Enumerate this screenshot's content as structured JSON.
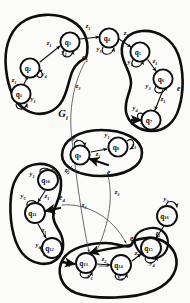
{
  "figure": {
    "title": "G",
    "title_subscript": "i",
    "background": "#fbfbfa",
    "ink_color": "#0d0d0d",
    "width": 190,
    "height": 303,
    "type": "hand-drawn-state-transition-graph"
  },
  "nodes": [
    {
      "id": "q1",
      "label": "q",
      "sub": "1",
      "cx": 21,
      "cy": 94
    },
    {
      "id": "q2",
      "label": "q",
      "sub": "2",
      "cx": 30,
      "cy": 68
    },
    {
      "id": "q3",
      "label": "q",
      "sub": "3",
      "cx": 70,
      "cy": 42
    },
    {
      "id": "q4",
      "label": "q",
      "sub": "4",
      "cx": 109,
      "cy": 38
    },
    {
      "id": "q5",
      "label": "q",
      "sub": "5",
      "cx": 140,
      "cy": 52
    },
    {
      "id": "q6",
      "label": "q",
      "sub": "6",
      "cx": 163,
      "cy": 79
    },
    {
      "id": "q7",
      "label": "q",
      "sub": "7",
      "cx": 151,
      "cy": 120
    },
    {
      "id": "q8",
      "label": "q",
      "sub": "8",
      "cx": 118,
      "cy": 147
    },
    {
      "id": "q9",
      "label": "q",
      "sub": "9",
      "cx": 80,
      "cy": 155
    },
    {
      "id": "q10",
      "label": "q",
      "sub": "10",
      "cx": 48,
      "cy": 180
    },
    {
      "id": "q11",
      "label": "q",
      "sub": "11",
      "cx": 35,
      "cy": 213
    },
    {
      "id": "q12",
      "label": "q",
      "sub": "12",
      "cx": 52,
      "cy": 248
    },
    {
      "id": "q13",
      "label": "q",
      "sub": "13",
      "cx": 86,
      "cy": 263
    },
    {
      "id": "q14",
      "label": "q",
      "sub": "14",
      "cx": 121,
      "cy": 265
    },
    {
      "id": "q15",
      "label": "q",
      "sub": "15",
      "cx": 151,
      "cy": 248
    },
    {
      "id": "q16",
      "label": "q",
      "sub": "16",
      "cx": 167,
      "cy": 216
    }
  ],
  "regions": [
    {
      "id": "e1",
      "label": "e",
      "sub": "1",
      "x": 85,
      "y": 58
    },
    {
      "id": "e2",
      "label": "e",
      "sub": "2",
      "x": 181,
      "y": 89
    },
    {
      "id": "e3",
      "label": "e",
      "sub": "3",
      "x": 110,
      "y": 173
    },
    {
      "id": "e4",
      "label": "e",
      "sub": "4",
      "x": 62,
      "y": 198
    },
    {
      "id": "e5",
      "label": "e",
      "sub": "5",
      "x": 133,
      "y": 239
    }
  ],
  "edge_labels": [
    {
      "id": "l-q1-q2",
      "sym": "z",
      "sub": "1",
      "x": 14,
      "y": 82
    },
    {
      "id": "l-q1-self",
      "sym": "y",
      "sub": "1",
      "x": 33,
      "y": 101
    },
    {
      "id": "l-q2-self",
      "sym": "y",
      "sub": "4",
      "x": 44,
      "y": 76
    },
    {
      "id": "l-q2-q3",
      "sym": "z",
      "sub": "1",
      "x": 49,
      "y": 45
    },
    {
      "id": "l-q3-self",
      "sym": "y",
      "sub": "2",
      "x": 64,
      "y": 54
    },
    {
      "id": "l-q3-q4",
      "sym": "z",
      "sub": "1",
      "x": 88,
      "y": 28
    },
    {
      "id": "l-q4-self",
      "sym": "y",
      "sub": "3",
      "x": 99,
      "y": 51
    },
    {
      "id": "l-q4-q5",
      "sym": "z",
      "sub": "1",
      "x": 126,
      "y": 35
    },
    {
      "id": "l-q5-self",
      "sym": "y",
      "sub": "1",
      "x": 130,
      "y": 64
    },
    {
      "id": "l-q5-q6",
      "sym": "z",
      "sub": "1",
      "x": 155,
      "y": 63
    },
    {
      "id": "l-q6-self",
      "sym": "y",
      "sub": "3",
      "x": 148,
      "y": 88
    },
    {
      "id": "l-q6-q7",
      "sym": "z",
      "sub": "1",
      "x": 163,
      "y": 101
    },
    {
      "id": "l-q7-self",
      "sym": "y",
      "sub": "4",
      "x": 135,
      "y": 110
    },
    {
      "id": "l-e1-z3",
      "sym": "z",
      "sub": "3",
      "x": 78,
      "y": 88
    },
    {
      "id": "l-q8-self",
      "sym": "z",
      "sub": "1",
      "x": 134,
      "y": 147
    },
    {
      "id": "l-q8-top",
      "sym": "y",
      "sub": "1",
      "x": 107,
      "y": 137
    },
    {
      "id": "l-q9-q8",
      "sym": "z",
      "sub": "1",
      "x": 98,
      "y": 156
    },
    {
      "id": "l-q9-self",
      "sym": "y",
      "sub": "2",
      "x": 75,
      "y": 140
    },
    {
      "id": "l-q9-z2",
      "sym": "z",
      "sub": "2",
      "x": 67,
      "y": 172
    },
    {
      "id": "l-q10-self",
      "sym": "y",
      "sub": "1",
      "x": 32,
      "y": 176
    },
    {
      "id": "l-q10-q11",
      "sym": "z",
      "sub": "1",
      "x": 47,
      "y": 198
    },
    {
      "id": "l-q11-self",
      "sym": "y",
      "sub": "5",
      "x": 23,
      "y": 198
    },
    {
      "id": "l-q11-q12",
      "sym": "z",
      "sub": "1",
      "x": 44,
      "y": 232
    },
    {
      "id": "l-q12-self",
      "sym": "y",
      "sub": "6",
      "x": 38,
      "y": 247
    },
    {
      "id": "l-e4-z3",
      "sym": "z",
      "sub": "3",
      "x": 84,
      "y": 207
    },
    {
      "id": "l-e3-z3",
      "sym": "z",
      "sub": "3",
      "x": 117,
      "y": 194
    },
    {
      "id": "l-q13-left",
      "sym": "z",
      "sub": "1",
      "x": 68,
      "y": 265
    },
    {
      "id": "l-q13-self",
      "sym": "y",
      "sub": "1",
      "x": 90,
      "y": 278
    },
    {
      "id": "l-q13-q14",
      "sym": "z",
      "sub": "2",
      "x": 104,
      "y": 261
    },
    {
      "id": "l-q14-self",
      "sym": "y",
      "sub": "3",
      "x": 120,
      "y": 279
    },
    {
      "id": "l-q14-q15",
      "sym": "z",
      "sub": "2",
      "x": 137,
      "y": 255
    },
    {
      "id": "l-q15-top",
      "sym": "z",
      "sub": "1",
      "x": 158,
      "y": 235
    },
    {
      "id": "l-q15-self",
      "sym": "y",
      "sub": "4",
      "x": 152,
      "y": 265
    },
    {
      "id": "l-q16-star",
      "sym": "y",
      "sub": "*",
      "x": 166,
      "y": 201
    }
  ]
}
